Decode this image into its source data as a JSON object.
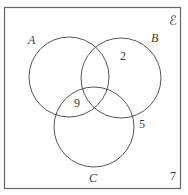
{
  "diagram": {
    "type": "venn",
    "universal_set_symbol": "ℰ",
    "sets": [
      {
        "label": "A",
        "cx": 69,
        "cy": 77,
        "r": 40
      },
      {
        "label": "B",
        "cx": 121,
        "cy": 78,
        "r": 40
      },
      {
        "label": "C",
        "cx": 94,
        "cy": 127,
        "r": 40
      }
    ],
    "regions": [
      {
        "description": "B only",
        "value": "2"
      },
      {
        "description": "A ∩ C only",
        "value": "9"
      },
      {
        "description": "outside all, near C/B",
        "value": "5"
      },
      {
        "description": "outside all sets",
        "value": "7"
      }
    ],
    "stroke_color": "#555555",
    "frame_color": "#666666"
  }
}
